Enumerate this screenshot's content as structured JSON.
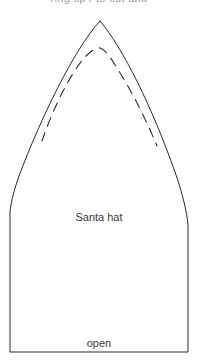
{
  "document": {
    "clipped_header_text": "ring tip / to cut and",
    "background_color": "#fefefe",
    "ink_color": "#2b2b2b"
  },
  "pattern": {
    "piece_name": "Santa hat",
    "bottom_edge_label": "open",
    "outline": {
      "name": "santa-hat-pattern-outline",
      "stroke": "#2b2b2b",
      "stroke_width": 1,
      "fill": "none",
      "apex_point": [
        100,
        21
      ],
      "left_side_x": 10,
      "right_side_x": 188,
      "bottom_y": 352,
      "curve_end_left_y": 212,
      "curve_end_right_y": 225
    },
    "seam_guide": {
      "name": "dashed-seam-line",
      "stroke": "#2b2b2b",
      "stroke_width": 1.1,
      "dash_pattern": "9 7",
      "apex_point": [
        100,
        48
      ],
      "left_end": [
        42,
        141
      ],
      "right_end": [
        157,
        146
      ]
    }
  }
}
